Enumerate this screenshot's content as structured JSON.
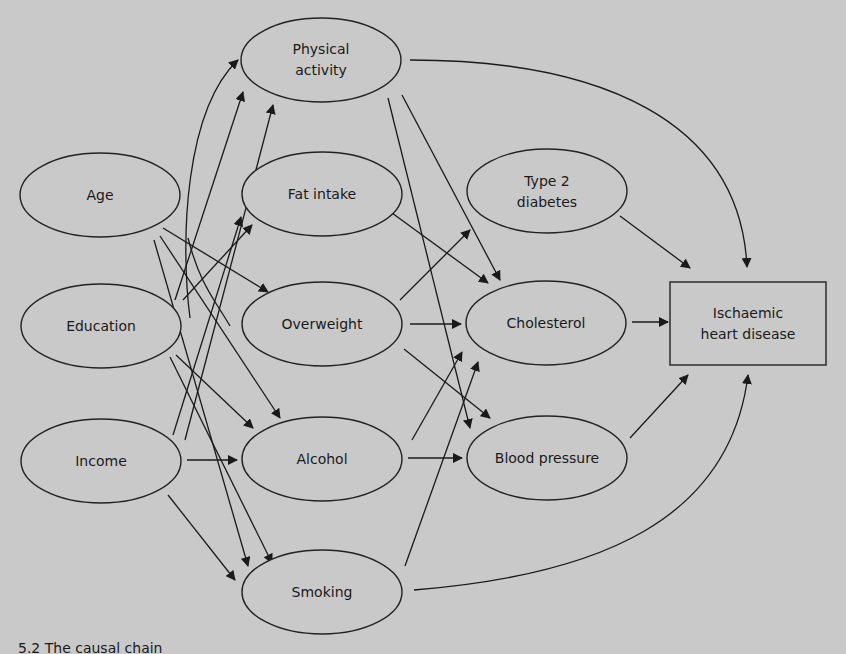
{
  "figure": {
    "caption_fragment": "5.2  The causal chain",
    "background": "#c9c9c9",
    "line_color": "#1a1a1a"
  },
  "nodes": {
    "physical_activity": {
      "line1": "Physical",
      "line2": "activity"
    },
    "age": {
      "label": "Age"
    },
    "fat_intake": {
      "label": "Fat intake"
    },
    "type2_diabetes": {
      "line1": "Type 2",
      "line2": "diabetes"
    },
    "education": {
      "label": "Education"
    },
    "overweight": {
      "label": "Overweight"
    },
    "cholesterol": {
      "label": "Cholesterol"
    },
    "ischaemic_heart_disease": {
      "line1": "Ischaemic",
      "line2": "heart disease"
    },
    "income": {
      "label": "Income"
    },
    "alcohol": {
      "label": "Alcohol"
    },
    "blood_pressure": {
      "label": "Blood pressure"
    },
    "smoking": {
      "label": "Smoking"
    }
  },
  "edges": [
    [
      "Age",
      "Physical activity"
    ],
    [
      "Education",
      "Physical activity"
    ],
    [
      "Income",
      "Physical activity"
    ],
    [
      "Age",
      "Fat intake"
    ],
    [
      "Education",
      "Fat intake"
    ],
    [
      "Income",
      "Fat intake"
    ],
    [
      "Age",
      "Overweight"
    ],
    [
      "Age",
      "Alcohol"
    ],
    [
      "Age",
      "Smoking"
    ],
    [
      "Education",
      "Alcohol"
    ],
    [
      "Education",
      "Smoking"
    ],
    [
      "Income",
      "Alcohol"
    ],
    [
      "Income",
      "Smoking"
    ],
    [
      "Physical activity",
      "Cholesterol"
    ],
    [
      "Physical activity",
      "Blood pressure"
    ],
    [
      "Physical activity",
      "Ischaemic heart disease"
    ],
    [
      "Fat intake",
      "Cholesterol"
    ],
    [
      "Overweight",
      "Type 2 diabetes"
    ],
    [
      "Overweight",
      "Cholesterol"
    ],
    [
      "Overweight",
      "Blood pressure"
    ],
    [
      "Alcohol",
      "Cholesterol"
    ],
    [
      "Alcohol",
      "Blood pressure"
    ],
    [
      "Smoking",
      "Cholesterol"
    ],
    [
      "Smoking",
      "Ischaemic heart disease"
    ],
    [
      "Type 2 diabetes",
      "Ischaemic heart disease"
    ],
    [
      "Cholesterol",
      "Ischaemic heart disease"
    ],
    [
      "Blood pressure",
      "Ischaemic heart disease"
    ]
  ]
}
